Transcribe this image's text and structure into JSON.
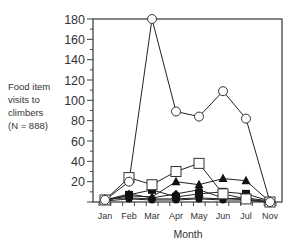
{
  "chart_data": {
    "type": "line",
    "title": "",
    "xlabel": "Month",
    "ylabel": "Food item visits to climbers (N = 888)",
    "ylabel_lines": [
      "Food item",
      "visits to",
      "climbers"
    ],
    "ylabel_n": "(N = 888)",
    "ylim": [
      0,
      180
    ],
    "yticks": [
      20,
      40,
      60,
      80,
      100,
      120,
      140,
      160,
      180
    ],
    "grid": false,
    "legend": "none",
    "categories": [
      "Jan",
      "Feb",
      "Mar",
      "Apr",
      "May",
      "Jun",
      "Jul",
      "Nov"
    ],
    "series": [
      {
        "name": "open circle",
        "marker": "open-circle",
        "values": [
          2,
          20,
          180,
          89,
          84,
          109,
          82,
          0
        ]
      },
      {
        "name": "open square",
        "marker": "open-square",
        "values": [
          2,
          24,
          17,
          30,
          38,
          8,
          3,
          0
        ]
      },
      {
        "name": "filled triangle",
        "marker": "filled-triangle",
        "values": [
          2,
          6,
          5,
          20,
          17,
          23,
          21,
          0
        ]
      },
      {
        "name": "filled square",
        "marker": "filled-square",
        "values": [
          1,
          7,
          12,
          5,
          8,
          10,
          8,
          1
        ]
      },
      {
        "name": "filled diamond",
        "marker": "filled-diamond",
        "values": [
          2,
          8,
          4,
          8,
          12,
          4,
          2,
          0
        ]
      },
      {
        "name": "filled circle",
        "marker": "filled-circle",
        "values": [
          1,
          3,
          2,
          2,
          3,
          2,
          2,
          0
        ]
      },
      {
        "name": "open star",
        "marker": "open-star",
        "values": [
          3,
          4,
          3,
          3,
          4,
          3,
          4,
          1
        ]
      }
    ]
  }
}
